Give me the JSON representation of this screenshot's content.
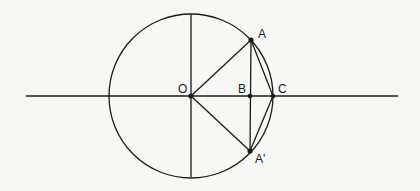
{
  "diagram": {
    "stroke_color": "#1a1a1a",
    "background_color": "#f7f7f5",
    "circle": {
      "cx": 191,
      "cy": 96,
      "r": 82
    },
    "axes": {
      "horizontal": {
        "x1": 26,
        "y1": 96,
        "x2": 398,
        "y2": 96
      },
      "vertical": {
        "x1": 191,
        "y1": 15,
        "x2": 191,
        "y2": 177
      }
    },
    "points": {
      "O": {
        "label": "O",
        "x": 191,
        "y": 96
      },
      "A": {
        "label": "A",
        "x": 251,
        "y": 40
      },
      "B": {
        "label": "B",
        "x": 250,
        "y": 96
      },
      "C": {
        "label": "C",
        "x": 273,
        "y": 96
      },
      "A_prime": {
        "label": "A'",
        "x": 250,
        "y": 151
      }
    },
    "segments": [
      [
        "O",
        "A"
      ],
      [
        "O",
        "A_prime"
      ],
      [
        "A",
        "A_prime"
      ],
      [
        "A",
        "C"
      ],
      [
        "A_prime",
        "C"
      ]
    ],
    "labels": {
      "O": "O",
      "A": "A",
      "B": "B",
      "C": "C",
      "A_prime": "A'"
    }
  }
}
